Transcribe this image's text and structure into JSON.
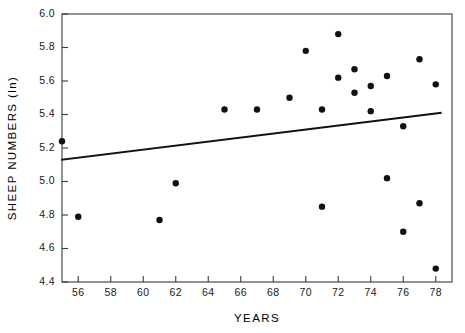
{
  "chart_data": {
    "type": "scatter",
    "title": "",
    "xlabel": "YEARS",
    "ylabel": "SHEEP NUMBERS (ln)",
    "xlim": [
      55,
      79
    ],
    "ylim": [
      4.4,
      6.0
    ],
    "grid": false,
    "legend": null,
    "x_ticks": [
      56,
      58,
      60,
      62,
      64,
      66,
      68,
      70,
      72,
      74,
      76,
      78
    ],
    "x_tick_labels": [
      "56",
      "58",
      "60",
      "62",
      "64",
      "66",
      "68",
      "70",
      "72",
      "74",
      "76",
      "78"
    ],
    "y_ticks": [
      4.4,
      4.6,
      4.8,
      5.0,
      5.2,
      5.4,
      5.6,
      5.8,
      6.0
    ],
    "y_tick_labels": [
      "4.4",
      "4.6",
      "4.8",
      "5.0",
      "5.2",
      "5.4",
      "5.6",
      "5.8",
      "6.0"
    ],
    "marker": "filled-circle",
    "marker_color": "#111111",
    "marker_size": 3.2,
    "points": [
      {
        "x": 55,
        "y": 5.24
      },
      {
        "x": 56,
        "y": 4.79
      },
      {
        "x": 61,
        "y": 4.77
      },
      {
        "x": 62,
        "y": 4.99
      },
      {
        "x": 65,
        "y": 5.43
      },
      {
        "x": 67,
        "y": 5.43
      },
      {
        "x": 69,
        "y": 5.5
      },
      {
        "x": 70,
        "y": 5.78
      },
      {
        "x": 71,
        "y": 5.43
      },
      {
        "x": 71,
        "y": 4.85
      },
      {
        "x": 72,
        "y": 5.88
      },
      {
        "x": 72,
        "y": 5.62
      },
      {
        "x": 73,
        "y": 5.67
      },
      {
        "x": 73,
        "y": 5.53
      },
      {
        "x": 74,
        "y": 5.57
      },
      {
        "x": 74,
        "y": 5.42
      },
      {
        "x": 75,
        "y": 5.63
      },
      {
        "x": 75,
        "y": 5.02
      },
      {
        "x": 76,
        "y": 5.33
      },
      {
        "x": 76,
        "y": 4.7
      },
      {
        "x": 77,
        "y": 5.73
      },
      {
        "x": 77,
        "y": 4.87
      },
      {
        "x": 78,
        "y": 5.58
      },
      {
        "x": 78,
        "y": 4.48
      }
    ],
    "trend_line": {
      "name": "regression-line",
      "color": "#111111",
      "x_start": 55,
      "y_start": 5.13,
      "x_end": 78.3,
      "y_end": 5.41
    }
  }
}
